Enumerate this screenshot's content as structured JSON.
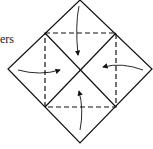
{
  "diagram": {
    "type": "origami-fold-instruction",
    "label_fragment": "ers",
    "shapes": {
      "outer_diamond": "solid square rotated 45 degrees",
      "inner_square": "dashed square (fold lines)",
      "diagonals": "solid X through center"
    },
    "arrows": [
      {
        "from": "top corner",
        "to": "center"
      },
      {
        "from": "left corner",
        "to": "center"
      },
      {
        "from": "right corner",
        "to": "center"
      },
      {
        "from": "bottom corner",
        "to": "center"
      }
    ],
    "colors": {
      "stroke": "#111111",
      "background": "#ffffff"
    }
  }
}
